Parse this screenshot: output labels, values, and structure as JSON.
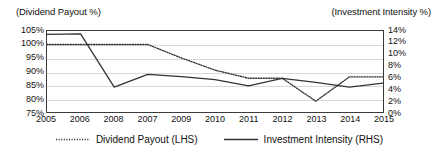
{
  "axis_captions": {
    "left": "(Dividend Payout %)",
    "right": "(Investment Intensity %)"
  },
  "legend": {
    "items": [
      {
        "label": "Dividend Payout (LHS)",
        "style": "dotted",
        "color": "#333333"
      },
      {
        "label": "Investment Intensity (RHS)",
        "style": "solid",
        "color": "#333333"
      }
    ]
  },
  "chart_data": {
    "type": "line",
    "title": "",
    "subtitle": "",
    "xlabel": "",
    "grid": true,
    "legend_position": "bottom",
    "categories": [
      "2005",
      "2006",
      "2008",
      "2007",
      "2009",
      "2010",
      "2011",
      "2012",
      "2013",
      "2014",
      "2015"
    ],
    "axes": {
      "left": {
        "label": "(Dividend Payout %)",
        "ylim": [
          75,
          105
        ],
        "ticks": [
          "75%",
          "80%",
          "85%",
          "90%",
          "95%",
          "100%",
          "105%"
        ],
        "tick_values": [
          75,
          80,
          85,
          90,
          95,
          100,
          105
        ]
      },
      "right": {
        "label": "(Investment Intensity %)",
        "ylim": [
          0,
          14
        ],
        "ticks": [
          "0%",
          "2%",
          "4%",
          "6%",
          "8%",
          "10%",
          "12%",
          "14%"
        ],
        "tick_values": [
          0,
          2,
          4,
          6,
          8,
          10,
          12,
          14
        ]
      }
    },
    "series": [
      {
        "name": "Dividend Payout (LHS)",
        "axis": "left",
        "style": "dotted",
        "color": "#333333",
        "values": [
          100,
          100,
          100,
          100,
          95,
          90.5,
          87.5,
          87.5,
          79,
          88,
          88
        ]
      },
      {
        "name": "Investment Intensity (RHS)",
        "axis": "right",
        "style": "solid",
        "color": "#333333",
        "values": [
          13.4,
          13.5,
          4.3,
          6.5,
          6.1,
          5.6,
          4.5,
          5.8,
          5.1,
          4.3,
          5.0
        ]
      }
    ]
  }
}
